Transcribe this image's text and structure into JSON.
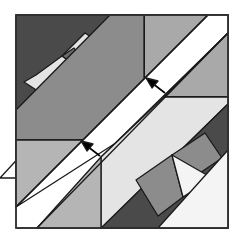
{
  "colors": {
    "dark": "#4a4a4a",
    "darkgray": "#6b6b6b",
    "gray": "#8c8c8c",
    "mid": "#a9a9a9",
    "light": "#c8c8c8",
    "pale": "#e4e4e4",
    "white": "#ffffff",
    "outline": "#1a1a1a"
  },
  "arrows": [
    {
      "name": "upper-arrow",
      "direction": "up-left"
    },
    {
      "name": "lower-arrow",
      "direction": "up-left"
    }
  ]
}
